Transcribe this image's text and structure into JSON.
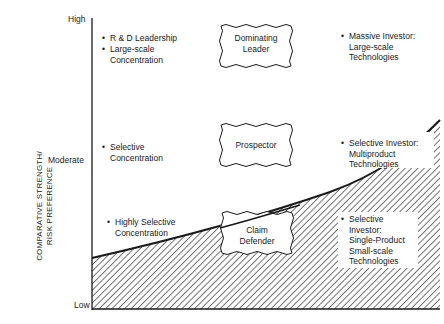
{
  "axis": {
    "y_title_line1": "COMPARATIVE STRENGTH/",
    "y_title_line2": "RISK PREFERENCE",
    "ticks": {
      "high": "High",
      "moderate": "Moderate",
      "low": "Low"
    }
  },
  "left_items": [
    {
      "lines": [
        "R & D Leadership"
      ]
    },
    {
      "lines": [
        "Large-scale",
        "Concentration"
      ]
    },
    {
      "lines": [
        "Selective",
        "Concentration"
      ]
    },
    {
      "lines": [
        "Highly Selective",
        "Concentration"
      ]
    }
  ],
  "boxes": [
    {
      "lines": [
        "Dominating",
        "Leader"
      ]
    },
    {
      "lines": [
        "Prospector"
      ]
    },
    {
      "lines": [
        "Claim",
        "Defender"
      ]
    }
  ],
  "right_items": [
    {
      "lines": [
        "Massive Investor:",
        "Large-scale",
        "Technologies"
      ]
    },
    {
      "lines": [
        "Selective Investor:",
        "Multiproduct",
        "Technologies"
      ]
    },
    {
      "lines": [
        "Selective",
        "Investor:",
        "Single-Product",
        "Small-scale",
        "Technologies"
      ]
    }
  ],
  "bullet": "•",
  "colors": {
    "ink": "#1a1a1a",
    "background": "#ffffff"
  }
}
